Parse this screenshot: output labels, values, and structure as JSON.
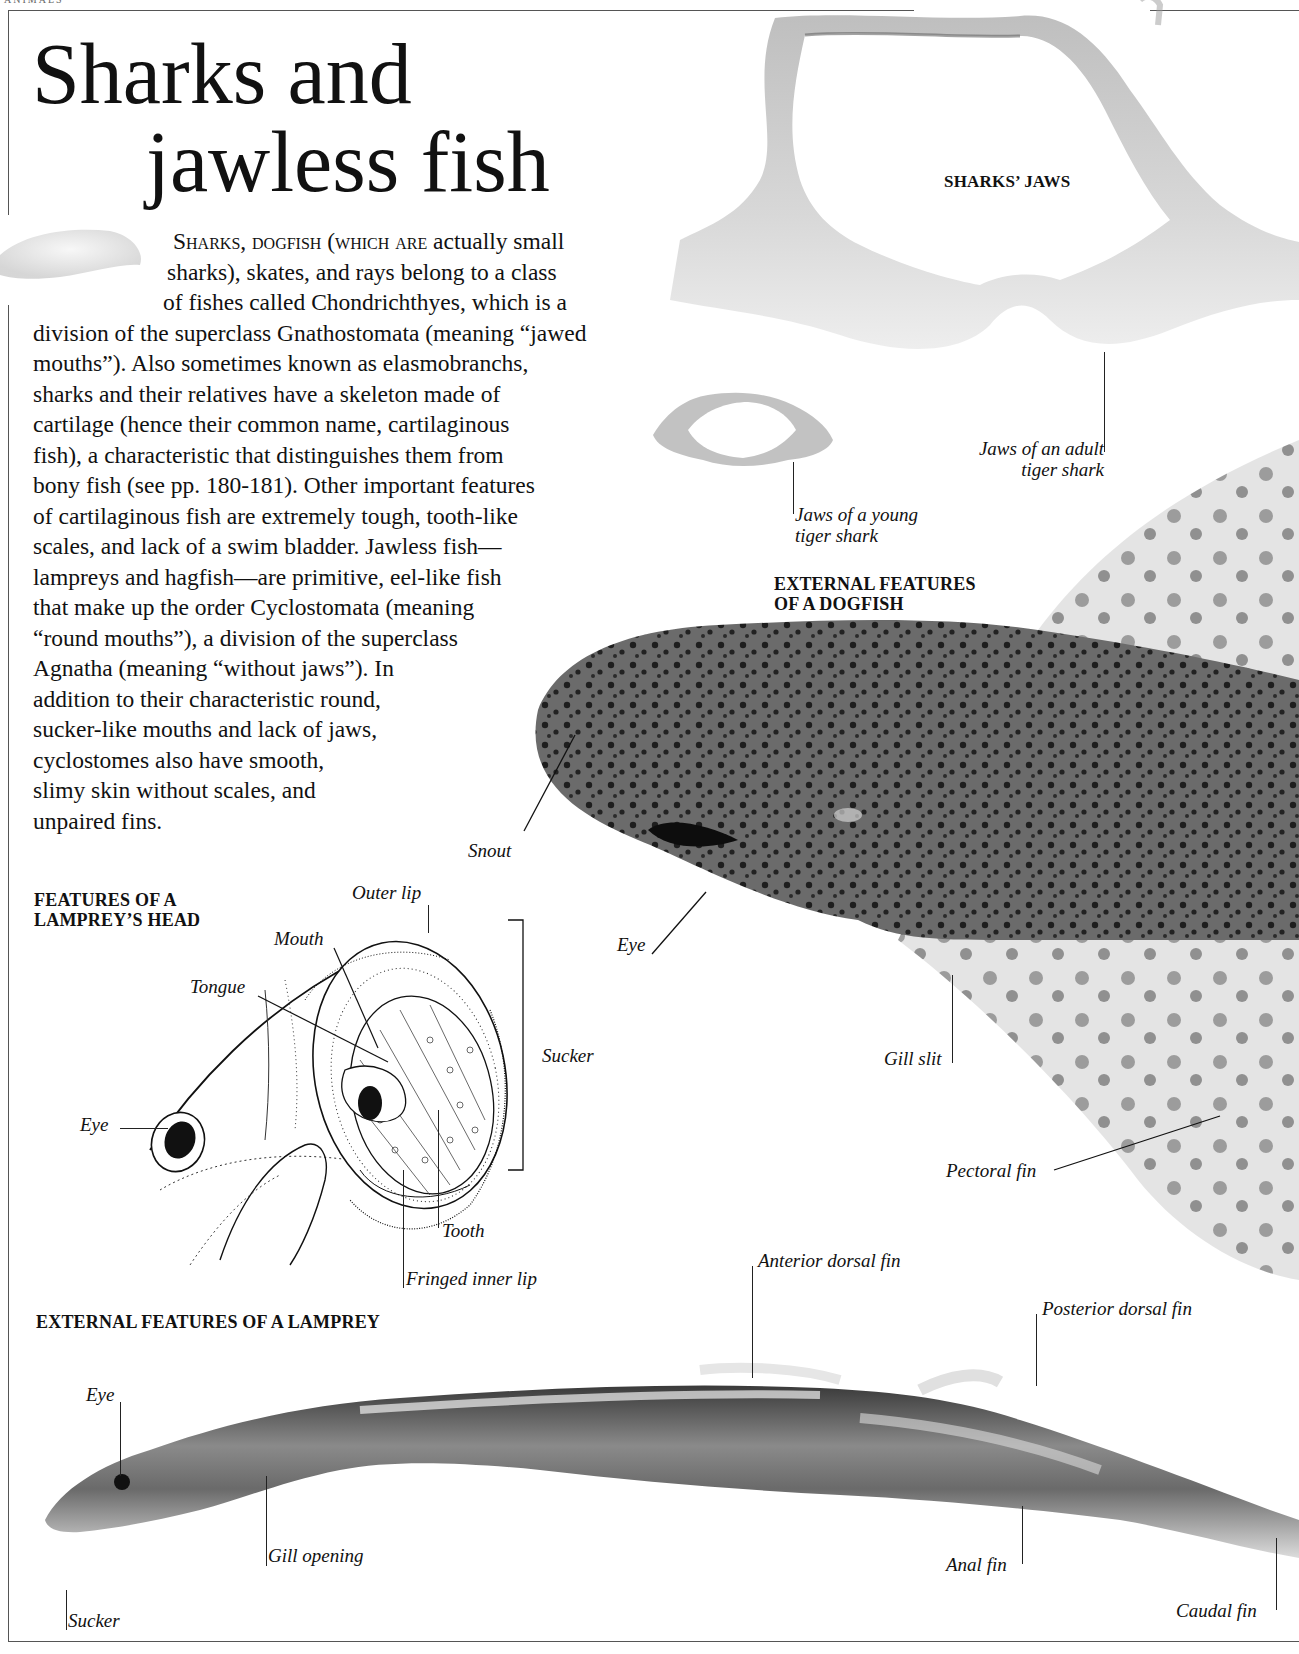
{
  "page": {
    "running_head": "ANIMALS"
  },
  "title": {
    "line1": "Sharks and",
    "line2": "jawless fish"
  },
  "intro": {
    "lead_small_caps": "Sharks, dogfish (which are",
    "lines": [
      " actually small",
      "sharks), skates, and rays belong to a class",
      "of fishes called Chondrichthyes, which is a",
      "division of the superclass Gnathostomata (meaning “jawed",
      "mouths”). Also sometimes known as elasmobranchs,",
      "sharks and their relatives have a skeleton made of",
      "cartilage (hence their common name, cartilaginous",
      "fish), a characteristic that distinguishes them from",
      "bony fish (see pp. 180-181). Other important features",
      "of cartilaginous fish are extremely tough, tooth-like",
      "scales, and lack of a swim bladder. Jawless fish—",
      "lampreys and hagfish—are primitive, eel-like fish",
      "that make up the order Cyclostomata (meaning",
      "“round mouths”), a division of the superclass",
      "Agnatha (meaning “without jaws”). In",
      "addition to their characteristic round,",
      "sucker-like mouths and lack of jaws,",
      "cyclostomes also have smooth,",
      "slimy skin without scales, and",
      "unpaired fins."
    ]
  },
  "sharks_jaws": {
    "heading": "SHARKS’ JAWS",
    "labels": {
      "adult_line1": "Jaws of an adult",
      "adult_line2": "tiger shark",
      "young_line1": "Jaws of a young",
      "young_line2": "tiger shark"
    }
  },
  "dogfish": {
    "heading_line1": "EXTERNAL FEATURES",
    "heading_line2": "OF A DOGFISH",
    "labels": {
      "snout": "Snout",
      "eye": "Eye",
      "gill_slit": "Gill slit",
      "pectoral_fin": "Pectoral fin"
    }
  },
  "lamprey_head": {
    "heading_line1": "FEATURES OF A",
    "heading_line2": "LAMPREY’S HEAD",
    "labels": {
      "outer_lip": "Outer lip",
      "mouth": "Mouth",
      "tongue": "Tongue",
      "eye": "Eye",
      "sucker": "Sucker",
      "tooth": "Tooth",
      "fringed_inner_lip": "Fringed inner lip"
    }
  },
  "lamprey": {
    "heading": "EXTERNAL FEATURES OF A LAMPREY",
    "labels": {
      "eye": "Eye",
      "gill_opening": "Gill opening",
      "sucker": "Sucker",
      "anterior_dorsal_fin": "Anterior dorsal fin",
      "posterior_dorsal_fin": "Posterior dorsal fin",
      "anal_fin": "Anal fin",
      "caudal_fin": "Caudal fin"
    }
  }
}
